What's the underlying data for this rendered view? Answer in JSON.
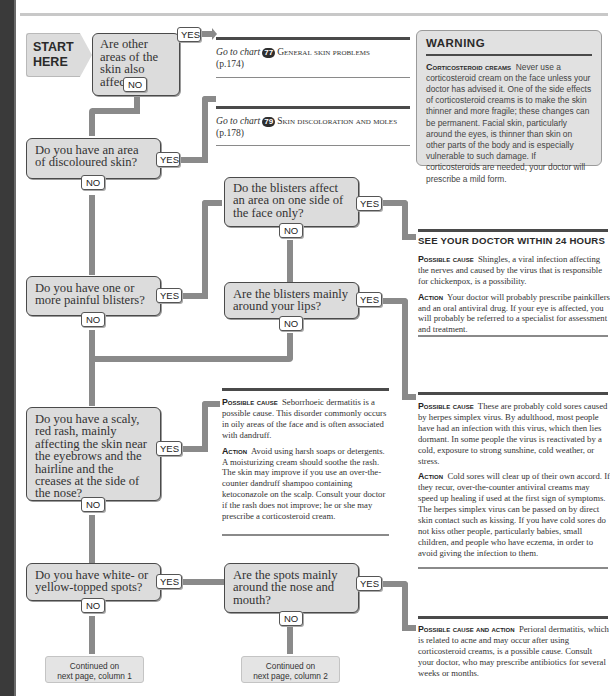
{
  "flowchart": {
    "start_label_1": "START",
    "start_label_2": "HERE",
    "yes_label": "YES",
    "no_label": "NO",
    "questions": [
      {
        "id": "q1",
        "text": "Are other areas of the skin also affected?"
      },
      {
        "id": "q2",
        "text": "Do you have an area of discoloured skin?"
      },
      {
        "id": "q3",
        "text": "Do the blisters affect an area on one side of the face only?"
      },
      {
        "id": "q4",
        "text": "Do you have one or more painful blisters?"
      },
      {
        "id": "q5",
        "text": "Are the blisters mainly around your lips?"
      },
      {
        "id": "q6",
        "text": "Do you have a scaly, red rash, mainly affecting the skin near the eyebrows and the hairline and the creases at the side of the nose?"
      },
      {
        "id": "q7",
        "text": "Do you have white- or yellow-topped spots?"
      },
      {
        "id": "q8",
        "text": "Are the spots mainly around the nose and mouth?"
      }
    ],
    "continued": [
      {
        "line1": "Continued on",
        "line2": "next page, column 1"
      },
      {
        "line1": "Continued on",
        "line2": "next page, column 2"
      }
    ]
  },
  "goto": [
    {
      "prefix": "Go to chart",
      "chart_number": "77",
      "title": "General skin problems",
      "page": "(p.174)"
    },
    {
      "prefix": "Go to chart",
      "chart_number": "79",
      "title": "Skin discoloration and moles",
      "page": "(p.178)"
    }
  ],
  "warning": {
    "title": "WARNING",
    "lead": "Corticosteroid creams",
    "body": "Never use a corticosteroid cream on the face unless your doctor has advised it. One of the side effects of corticosteroid creams is to make the skin thinner and more fragile; these changes can be permanent. Facial skin, particularly around the eyes, is thinner than skin on other parts of the body and is especially vulnerable to such damage. If corticosteroids are needed, your doctor will prescribe a mild form."
  },
  "outcomes": {
    "shingles": {
      "heading": "SEE YOUR DOCTOR WITHIN 24 HOURS",
      "cause_label": "Possible cause",
      "cause": "Shingles, a viral infection affecting the nerves and caused by the virus that is responsible for chickenpox, is a possibility.",
      "action_label": "Action",
      "action": "Your doctor will probably prescribe painkillers and an oral antiviral drug. If your eye is affected, you will probably be referred to a specialist for assessment and treatment."
    },
    "seborrhoeic": {
      "cause_label": "Possible cause",
      "cause": "Seborrhoeic dermatitis is a possible cause. This disorder commonly occurs in oily areas of the face and is often associated with dandruff.",
      "action_label": "Action",
      "action": "Avoid using harsh soaps or detergents. A moisturizing cream should soothe the rash. The skin may improve if you use an over-the-counter dandruff shampoo containing ketoconazole on the scalp. Consult your doctor if the rash does not improve; he or she may prescribe a corticosteroid cream."
    },
    "cold_sores": {
      "cause_label": "Possible cause",
      "cause": "These are probably cold sores caused by herpes simplex virus. By adulthood, most people have had an infection with this virus, which then lies dormant. In some people the virus is reactivated by a cold, exposure to strong sunshine, cold weather, or stress.",
      "action_label": "Action",
      "action": "Cold sores will clear up of their own accord. If they recur, over-the-counter antiviral creams may speed up healing if used at the first sign of symptoms. The herpes simplex virus can be passed on by direct skin contact such as kissing. If you have cold sores do not kiss other people, particularly babies, small children, and people who have eczema, in order to avoid giving the infection to them."
    },
    "perioral": {
      "label": "Possible cause and action",
      "text": "Perioral dermatitis, which is related to acne and may occur after using corticosteroid creams, is a possible cause. Consult your doctor, who may prescribe antibiotics for several weeks or months."
    }
  },
  "colors": {
    "box_fill": "#dcdcdc",
    "box_border": "#4a4a4a",
    "pipe": "#8a8a8a",
    "warning_fill": "#e1e1e1",
    "left_bar": "#3a3a3a"
  }
}
